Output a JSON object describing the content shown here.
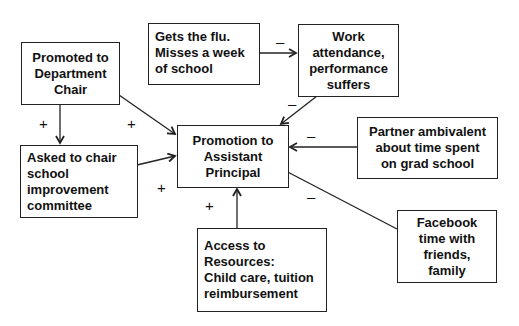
{
  "diagram": {
    "nodes": {
      "promoted_dept_chair": {
        "lines": [
          "Promoted to",
          "Department",
          "Chair"
        ]
      },
      "gets_flu": {
        "lines": [
          "Gets the flu.",
          "Misses a week",
          "of school"
        ]
      },
      "work_attendance": {
        "lines": [
          "Work",
          "attendance,",
          "performance",
          "suffers"
        ]
      },
      "promotion_ap": {
        "lines": [
          "Promotion to",
          "Assistant",
          "Principal"
        ]
      },
      "asked_to_chair": {
        "lines": [
          "Asked to chair",
          "school",
          "improvement",
          "committee"
        ]
      },
      "partner_ambivalent": {
        "lines": [
          "Partner ambivalent",
          "about time spent",
          "on grad school"
        ]
      },
      "facebook": {
        "lines": [
          "Facebook",
          "time with",
          "friends,",
          "family"
        ]
      },
      "access_resources": {
        "lines": [
          "Access to",
          "Resources:",
          "Child care, tuition",
          "reimbursement"
        ]
      }
    },
    "edges": [
      {
        "from": "promoted_dept_chair",
        "to": "asked_to_chair",
        "sign": "+"
      },
      {
        "from": "promoted_dept_chair",
        "to": "promotion_ap",
        "sign": "+"
      },
      {
        "from": "asked_to_chair",
        "to": "promotion_ap",
        "sign": "+"
      },
      {
        "from": "gets_flu",
        "to": "work_attendance",
        "sign": "–"
      },
      {
        "from": "work_attendance",
        "to": "promotion_ap",
        "sign": "–"
      },
      {
        "from": "partner_ambivalent",
        "to": "promotion_ap",
        "sign": "–"
      },
      {
        "from": "facebook",
        "to": "promotion_ap",
        "sign": "–"
      },
      {
        "from": "access_resources",
        "to": "promotion_ap",
        "sign": "+"
      }
    ]
  }
}
